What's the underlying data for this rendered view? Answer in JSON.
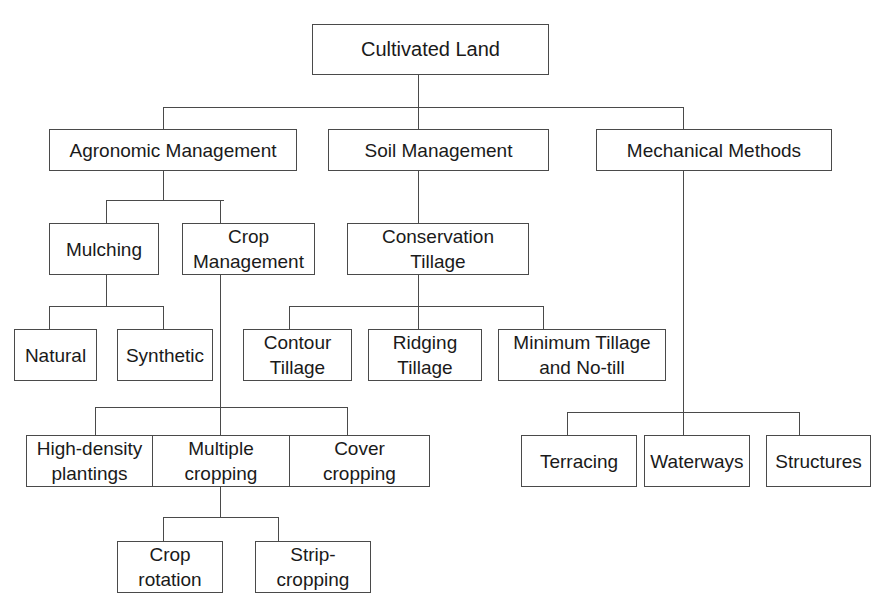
{
  "diagram": {
    "title": "Cultivated Land",
    "root": {
      "label": "Cultivated Land"
    },
    "level1": [
      {
        "label": "Agronomic Management"
      },
      {
        "label": "Soil Management"
      },
      {
        "label": "Mechanical Methods"
      }
    ],
    "agronomic": {
      "children": [
        {
          "label": "Mulching"
        },
        {
          "label": "Crop\nManagement"
        }
      ],
      "mulching_children": [
        {
          "label": "Natural"
        },
        {
          "label": "Synthetic"
        }
      ],
      "crop_management_children": [
        {
          "label": "High-density\nplantings"
        },
        {
          "label": "Multiple\ncropping"
        },
        {
          "label": "Cover\ncropping"
        }
      ],
      "multiple_cropping_children": [
        {
          "label": "Crop\nrotation"
        },
        {
          "label": "Strip-\ncropping"
        }
      ]
    },
    "soil": {
      "children": [
        {
          "label": "Conservation\nTillage"
        }
      ],
      "conservation_tillage_children": [
        {
          "label": "Contour\nTillage"
        },
        {
          "label": "Ridging\nTillage"
        },
        {
          "label": "Minimum Tillage\nand No-till"
        }
      ]
    },
    "mechanical": {
      "children": [
        {
          "label": "Terracing"
        },
        {
          "label": "Waterways"
        },
        {
          "label": "Structures"
        }
      ]
    }
  }
}
